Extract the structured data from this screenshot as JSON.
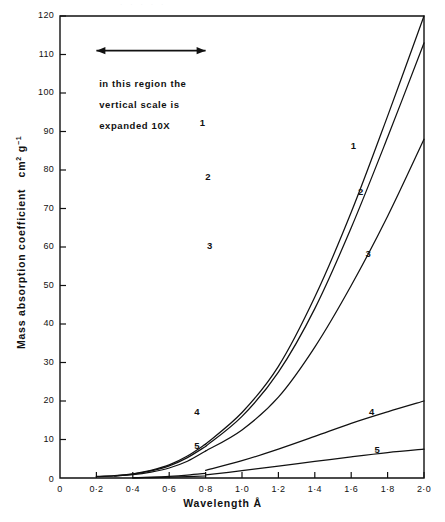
{
  "figure": {
    "top_artifact_text": "· · ·   · ·",
    "annotation_lines": [
      "in this region the",
      "vertical scale is",
      "expanded 10X"
    ],
    "annotation_arrow_name": "expanded-region-arrow"
  },
  "chart_data": {
    "type": "line",
    "title": "",
    "xlabel": "Wavelength  Å",
    "ylabel": "Mass  absorption  coefficient   cm2 g-1",
    "ylabel_unit_base": "cm",
    "ylabel_unit_sup1": "2",
    "ylabel_unit_mid": " g",
    "ylabel_unit_sup2": "-1",
    "xlim": [
      0,
      2.0
    ],
    "ylim": [
      0,
      120
    ],
    "grid": false,
    "legend": "inline-curve-labels",
    "xticks": [
      0,
      0.2,
      0.4,
      0.6,
      0.8,
      1.0,
      1.2,
      1.4,
      1.6,
      1.8,
      2.0
    ],
    "xtick_labels": [
      "0",
      "0·2",
      "0·4",
      "0·6",
      "0·8",
      "1·0",
      "1·2",
      "1·4",
      "1·6",
      "1·8",
      "2·0"
    ],
    "yticks": [
      0,
      10,
      20,
      30,
      40,
      50,
      60,
      70,
      80,
      90,
      100,
      110,
      120
    ],
    "ytick_labels": [
      "0",
      "10",
      "20",
      "30",
      "40",
      "50",
      "60",
      "70",
      "80",
      "90",
      "100",
      "110",
      "120"
    ],
    "regions": [
      {
        "name": "expanded-region",
        "x_range": [
          0.2,
          0.8
        ],
        "vertical_scale_factor": 10
      },
      {
        "name": "normal-region",
        "x_range": [
          0.8,
          2.0
        ],
        "vertical_scale_factor": 1
      }
    ],
    "series": [
      {
        "name": "1",
        "label": "1",
        "expanded": {
          "x": [
            0.2,
            0.3,
            0.4,
            0.5,
            0.6,
            0.7,
            0.8
          ],
          "y": [
            4.0,
            6.0,
            11.0,
            20.0,
            34.0,
            57.0,
            88.0
          ]
        },
        "normal": {
          "x": [
            0.8,
            1.0,
            1.2,
            1.4,
            1.6,
            1.8,
            2.0
          ],
          "y": [
            8.8,
            17.0,
            29.0,
            47.0,
            69.0,
            94.0,
            120.0
          ]
        },
        "label_positions": {
          "expanded": [
            0.79,
            92
          ],
          "normal": [
            1.62,
            86
          ]
        }
      },
      {
        "name": "2",
        "label": "2",
        "expanded": {
          "x": [
            0.2,
            0.3,
            0.4,
            0.5,
            0.6,
            0.7,
            0.8
          ],
          "y": [
            3.6,
            5.6,
            10.0,
            18.5,
            31.5,
            53.0,
            82.0
          ]
        },
        "normal": {
          "x": [
            0.8,
            1.0,
            1.2,
            1.4,
            1.6,
            1.8,
            2.0
          ],
          "y": [
            8.2,
            16.0,
            27.5,
            44.0,
            65.0,
            88.5,
            113.0
          ]
        },
        "label_positions": {
          "expanded": [
            0.82,
            78
          ],
          "normal": [
            1.66,
            74
          ]
        }
      },
      {
        "name": "3",
        "label": "3",
        "expanded": {
          "x": [
            0.3,
            0.4,
            0.5,
            0.6,
            0.7,
            0.8
          ],
          "y": [
            5.0,
            8.5,
            15.5,
            26.0,
            43.5,
            70.0
          ]
        },
        "normal": {
          "x": [
            0.8,
            1.0,
            1.2,
            1.4,
            1.6,
            1.8,
            2.0
          ],
          "y": [
            7.0,
            12.5,
            21.0,
            34.0,
            50.0,
            68.0,
            88.0
          ]
        },
        "label_positions": {
          "expanded": [
            0.83,
            60
          ],
          "normal": [
            1.7,
            58
          ]
        }
      },
      {
        "name": "4",
        "label": "4",
        "expanded": {
          "x": [
            0.4,
            0.5,
            0.6,
            0.7,
            0.8
          ],
          "y": [
            0.5,
            2.0,
            4.2,
            7.5,
            12.0
          ]
        },
        "normal": {
          "x": [
            0.8,
            1.0,
            1.2,
            1.4,
            1.6,
            1.8,
            2.0
          ],
          "y": [
            2.0,
            4.5,
            7.5,
            10.8,
            14.2,
            17.2,
            20.0
          ]
        },
        "label_positions": {
          "expanded": [
            0.76,
            17
          ],
          "normal": [
            1.72,
            17
          ]
        }
      },
      {
        "name": "5",
        "label": "5",
        "expanded": {
          "x": [
            0.4,
            0.5,
            0.6,
            0.7,
            0.8
          ],
          "y": [
            0.3,
            1.2,
            2.4,
            3.8,
            5.2
          ]
        },
        "normal": {
          "x": [
            0.8,
            1.0,
            1.2,
            1.4,
            1.6,
            1.8,
            2.0
          ],
          "y": [
            0.8,
            1.9,
            3.1,
            4.3,
            5.5,
            6.6,
            7.5
          ]
        },
        "label_positions": {
          "expanded": [
            0.76,
            8
          ],
          "normal": [
            1.75,
            7
          ]
        }
      }
    ]
  }
}
